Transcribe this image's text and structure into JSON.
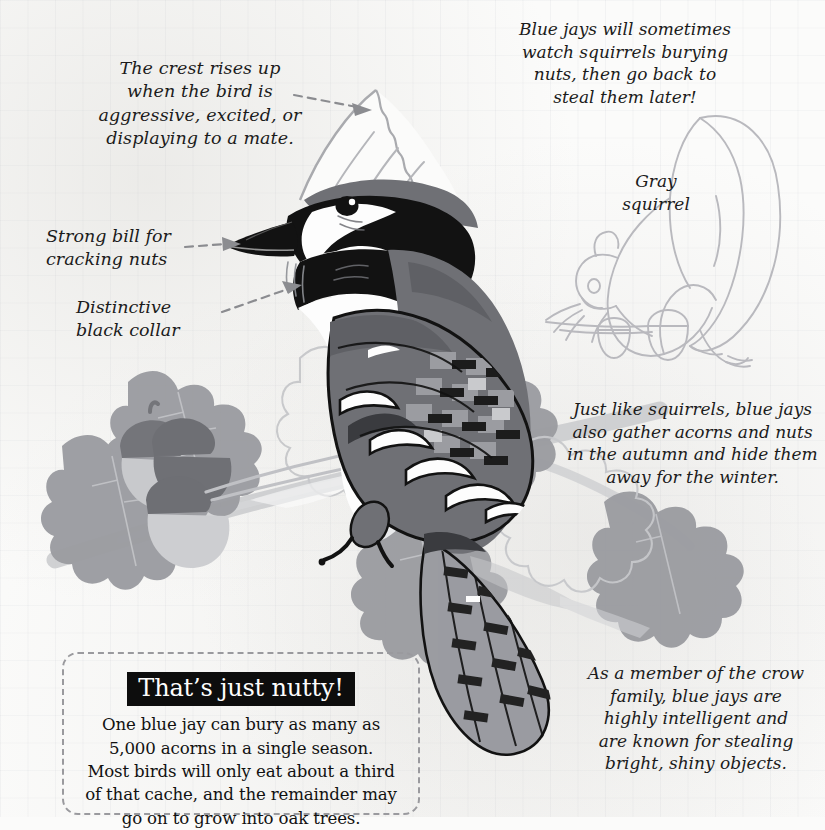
{
  "page": {
    "background_color": "#fbfbfa",
    "grid_color": "#969baa"
  },
  "annotations": [
    {
      "id": "crest",
      "name": "annotation-crest",
      "text": "The crest rises up\nwhen the bird is\naggressive, excited, or\ndisplaying to a mate.",
      "has_arrow": true,
      "points_to": "bird-crest"
    },
    {
      "id": "bill",
      "name": "annotation-bill",
      "text": "Strong bill for\ncracking nuts",
      "has_arrow": true,
      "points_to": "bird-bill"
    },
    {
      "id": "collar",
      "name": "annotation-collar",
      "text": "Distinctive\nblack collar",
      "has_arrow": true,
      "points_to": "bird-collar"
    }
  ],
  "notes": [
    {
      "id": "squirrel-fact",
      "name": "note-squirrel-watching",
      "text": "Blue jays will sometimes\nwatch squirrels burying\nnuts, then go back to\nsteal them later!"
    },
    {
      "id": "acorn-fact",
      "name": "note-acorn-caching",
      "text": "Just like squirrels, blue jays\nalso gather acorns and nuts\nin the autumn and hide them\naway for the winter."
    },
    {
      "id": "crow-fact",
      "name": "note-crow-family",
      "text": "As a member of the crow\nfamily, blue jays are\nhighly intelligent and\nare known for stealing\nbright, shiny objects."
    }
  ],
  "labels": {
    "gray_squirrel": "Gray\nsquirrel"
  },
  "fact_box": {
    "banner": "That’s just nutty!",
    "body": "One blue jay can bury as many as\n5,000 acorns in a single season.\nMost birds will only eat about a third\nof that cache, and the remainder may\ngo on to grow into oak trees.",
    "border_style": "dashed",
    "border_color": "#9a9a9e",
    "banner_background": "#0d0d0d",
    "banner_text_color": "#fdfdfd"
  },
  "illustration": {
    "subject": "blue-jay",
    "palette": {
      "ink": "#111111",
      "dark_gray": "#6f7075",
      "mid_gray": "#8e9095",
      "light_gray": "#adaeb2",
      "pale_gray": "#cfd0d2",
      "white": "#fdfdfd",
      "faint_line": "#b9b9be",
      "leaf_gray": "#9a9ba0",
      "leaf_dark": "#7f8085",
      "acorn_cap": "#7b7c81",
      "acorn_nut": "#c3c4c7"
    },
    "elements": [
      "bird-crest",
      "bird-bill",
      "bird-eye",
      "bird-collar",
      "bird-wing",
      "bird-tail",
      "bird-foot",
      "oak-branch",
      "oak-leaves",
      "acorns",
      "gray-squirrel-outline",
      "squirrel-acorns"
    ]
  }
}
